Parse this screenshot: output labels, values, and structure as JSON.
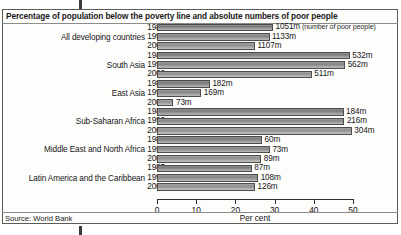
{
  "figure": {
    "title": "Percentage of population below the poverty line and absolute numbers of poor people",
    "source": "Source: World Bank",
    "axis_title": "Per cent",
    "annotation": "(number of poor people)"
  },
  "axis": {
    "ticks": [
      "0",
      "10",
      "20",
      "30",
      "40",
      "50"
    ]
  },
  "groups": [
    {
      "region": "All developing countries",
      "rows": [
        {
          "year": "1985",
          "percent": 29.6,
          "count_label": "1051m",
          "note": " (number of poor people)"
        },
        {
          "year": "1990",
          "percent": 28.7,
          "count_label": "1133m",
          "note": ""
        },
        {
          "year": "2000",
          "percent": 25.0,
          "count_label": "1107m",
          "note": ""
        }
      ]
    },
    {
      "region": "South Asia",
      "rows": [
        {
          "year": "1985",
          "percent": 49.2,
          "count_label": "532m",
          "note": ""
        },
        {
          "year": "1990",
          "percent": 48.0,
          "count_label": "562m",
          "note": ""
        },
        {
          "year": "2000",
          "percent": 39.5,
          "count_label": "511m",
          "note": ""
        }
      ]
    },
    {
      "region": "East Asia",
      "rows": [
        {
          "year": "1985",
          "percent": 13.5,
          "count_label": "182m",
          "note": ""
        },
        {
          "year": "1990",
          "percent": 11.3,
          "count_label": "169m",
          "note": ""
        },
        {
          "year": "2000",
          "percent": 4.2,
          "count_label": "73m",
          "note": ""
        }
      ]
    },
    {
      "region": "Sub-Saharan Africa",
      "rows": [
        {
          "year": "1985",
          "percent": 47.6,
          "count_label": "184m",
          "note": ""
        },
        {
          "year": "1990",
          "percent": 47.8,
          "count_label": "216m",
          "note": ""
        },
        {
          "year": "2000",
          "percent": 49.7,
          "count_label": "304m",
          "note": ""
        }
      ]
    },
    {
      "region": "Middle East and North Africa",
      "rows": [
        {
          "year": "1985",
          "percent": 26.8,
          "count_label": "60m",
          "note": ""
        },
        {
          "year": "1990",
          "percent": 28.8,
          "count_label": "73m",
          "note": ""
        },
        {
          "year": "2000",
          "percent": 26.6,
          "count_label": "89m",
          "note": ""
        }
      ]
    },
    {
      "region": "Latin America and the Caribbean",
      "rows": [
        {
          "year": "1985",
          "percent": 24.2,
          "count_label": "87m",
          "note": ""
        },
        {
          "year": "1990",
          "percent": 25.8,
          "count_label": "108m",
          "note": ""
        },
        {
          "year": "2000",
          "percent": 25.0,
          "count_label": "126m",
          "note": ""
        }
      ]
    }
  ],
  "chart_data": {
    "type": "bar",
    "orientation": "horizontal",
    "title": "Percentage of population below the poverty line and absolute numbers of poor people",
    "xlabel": "Per cent",
    "ylabel": "",
    "xlim": [
      0,
      50
    ],
    "xticks": [
      0,
      10,
      20,
      30,
      40,
      50
    ],
    "grid": false,
    "legend": "none",
    "categories": [
      "All developing countries",
      "South Asia",
      "East Asia",
      "Sub-Saharan Africa",
      "Middle East and North Africa",
      "Latin America and the Caribbean"
    ],
    "series": [
      {
        "name": "1985",
        "values": [
          29.6,
          49.2,
          13.5,
          47.6,
          26.8,
          24.2
        ]
      },
      {
        "name": "1990",
        "values": [
          28.7,
          48.0,
          11.3,
          47.8,
          28.8,
          25.8
        ]
      },
      {
        "name": "2000",
        "values": [
          25.0,
          39.5,
          4.2,
          49.7,
          26.6,
          25.0
        ]
      }
    ],
    "data_labels": {
      "1985": [
        "1051m",
        "532m",
        "182m",
        "184m",
        "60m",
        "87m"
      ],
      "1990": [
        "1133m",
        "562m",
        "169m",
        "216m",
        "73m",
        "108m"
      ],
      "2000": [
        "1107m",
        "511m",
        "73m",
        "304m",
        "89m",
        "126m"
      ]
    },
    "annotations": [
      "1051m (number of poor people)"
    ],
    "source": "Source: World Bank"
  }
}
